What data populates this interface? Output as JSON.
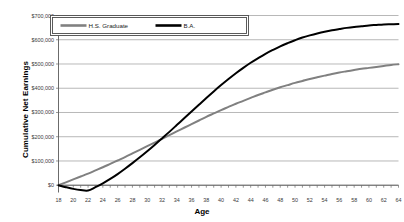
{
  "chart_data": {
    "type": "line",
    "title": "",
    "xlabel": "Age",
    "ylabel": "Cumulative Net Earnings",
    "xlim": [
      18,
      64
    ],
    "ylim": [
      -30000,
      700000
    ],
    "grid": true,
    "legend_position": "top-left-inside",
    "y_ticks": [
      0,
      100000,
      200000,
      300000,
      400000,
      500000,
      600000,
      700000
    ],
    "y_tick_labels": [
      "$0",
      "$100,000",
      "$200,000",
      "$300,000",
      "$400,000",
      "$500,000",
      "$600,000",
      "$700,000"
    ],
    "x_ticks": [
      18,
      20,
      22,
      24,
      26,
      28,
      30,
      32,
      34,
      36,
      38,
      40,
      42,
      44,
      46,
      48,
      50,
      52,
      54,
      56,
      58,
      60,
      62,
      64
    ],
    "x_tick_labels": [
      "18",
      "20",
      "22",
      "24",
      "26",
      "28",
      "30",
      "32",
      "34",
      "36",
      "38",
      "40",
      "42",
      "44",
      "46",
      "48",
      "50",
      "52",
      "54",
      "56",
      "58",
      "60",
      "62",
      "64"
    ],
    "x": [
      18,
      19,
      20,
      21,
      22,
      23,
      24,
      25,
      26,
      27,
      28,
      29,
      30,
      31,
      32,
      33,
      34,
      35,
      36,
      37,
      38,
      39,
      40,
      41,
      42,
      43,
      44,
      45,
      46,
      47,
      48,
      49,
      50,
      51,
      52,
      53,
      54,
      55,
      56,
      57,
      58,
      59,
      60,
      61,
      62,
      63,
      64
    ],
    "series": [
      {
        "name": "H.S. Graduate",
        "color": "#808080",
        "values": [
          0,
          12000,
          24000,
          36000,
          48000,
          61000,
          74000,
          88000,
          102000,
          116000,
          131000,
          146000,
          161000,
          176000,
          191000,
          207000,
          222000,
          237000,
          252000,
          267000,
          282000,
          296000,
          310000,
          323000,
          336000,
          348000,
          360000,
          372000,
          383000,
          394000,
          404000,
          413000,
          422000,
          430000,
          438000,
          445000,
          452000,
          459000,
          465000,
          470000,
          475000,
          480000,
          484000,
          488000,
          492000,
          496000,
          499000
        ]
      },
      {
        "name": "B.A.",
        "color": "#000000",
        "values": [
          0,
          -8000,
          -15000,
          -20000,
          -22000,
          -8000,
          8000,
          26000,
          46000,
          68000,
          91000,
          115000,
          140000,
          166000,
          193000,
          220000,
          248000,
          276000,
          304000,
          332000,
          360000,
          387000,
          413000,
          438000,
          462000,
          484000,
          505000,
          524000,
          542000,
          558000,
          573000,
          586000,
          598000,
          609000,
          618000,
          626000,
          633000,
          639000,
          644000,
          649000,
          653000,
          656000,
          659000,
          661000,
          663000,
          664000,
          665000
        ]
      }
    ]
  },
  "legend": {
    "items": [
      {
        "label": "H.S. Graduate",
        "color": "#808080"
      },
      {
        "label": "B.A.",
        "color": "#000000"
      }
    ]
  },
  "axes": {
    "y_title": "Cumulative Net Earnings",
    "x_title": "Age"
  }
}
